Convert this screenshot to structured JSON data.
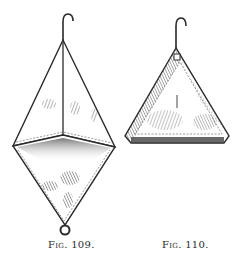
{
  "figures": [
    {
      "id": "fig109",
      "caption": "Fig. 109.",
      "shape": "double-pyramid (octahedral) net bag with hook and bottom ring"
    },
    {
      "id": "fig110",
      "caption": "Fig. 110.",
      "shape": "pyramid (tetrahedral) net bag with hook"
    }
  ],
  "colors": {
    "ink": "#2a2a2a",
    "paper": "#ffffff",
    "shade": "#6b6b6b"
  }
}
